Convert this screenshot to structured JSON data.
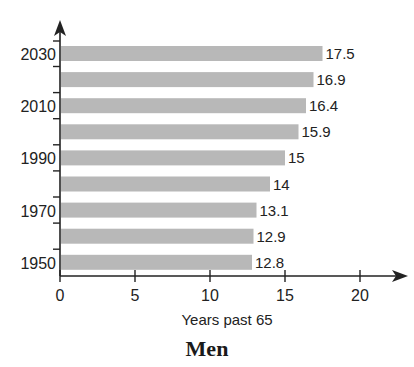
{
  "chart_data": {
    "type": "bar",
    "orientation": "horizontal",
    "title": "Men",
    "xlabel": "Years past 65",
    "ylabel": "",
    "categories": [
      "1950",
      "1960",
      "1970",
      "1980",
      "1990",
      "2000",
      "2010",
      "2020",
      "2030"
    ],
    "values": [
      12.8,
      12.9,
      13.1,
      14,
      15,
      15.9,
      16.4,
      16.9,
      17.5
    ],
    "value_labels": [
      "12.8",
      "12.9",
      "13.1",
      "14",
      "15",
      "15.9",
      "16.4",
      "16.9",
      "17.5"
    ],
    "y_tick_labels": [
      "1950",
      "1970",
      "1990",
      "2010",
      "2030"
    ],
    "x_ticks": [
      0,
      5,
      10,
      15,
      20
    ],
    "xlim": [
      0,
      22
    ],
    "grid": false,
    "legend": null,
    "bar_color": "#b8b8b8"
  },
  "labels": {
    "title": "Men",
    "xlabel": "Years past 65"
  }
}
